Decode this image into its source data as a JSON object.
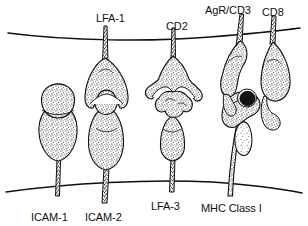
{
  "figure": {
    "background_color": "#ffffff",
    "ink_color": "#101010",
    "stipple_color": "#2a2a2a",
    "label_font_size_px": 11
  },
  "membranes": [
    {
      "name": "top-membrane",
      "semantic": "antigen-presenting-cell-membrane",
      "position": "top",
      "description": "gently sagging curved line across full width"
    },
    {
      "name": "bottom-membrane",
      "semantic": "t-cell-membrane",
      "position": "bottom",
      "description": "gently arched curved line across full width"
    }
  ],
  "labels": {
    "top": [
      {
        "id": "lfa1",
        "text": "LFA-1",
        "x": 96,
        "y": 12
      },
      {
        "id": "cd2",
        "text": "CD2",
        "x": 166,
        "y": 20
      },
      {
        "id": "agr_cd3",
        "text": "AgR/CD3",
        "x": 205,
        "y": 4
      },
      {
        "id": "cd8",
        "text": "CD8",
        "x": 262,
        "y": 6
      }
    ],
    "bottom": [
      {
        "id": "icam1",
        "text": "ICAM-1",
        "x": 31,
        "y": 211
      },
      {
        "id": "icam2",
        "text": "ICAM-2",
        "x": 85,
        "y": 211
      },
      {
        "id": "lfa3",
        "text": "LFA-3",
        "x": 151,
        "y": 200
      },
      {
        "id": "mhc1",
        "text": "MHC Class I",
        "x": 201,
        "y": 202
      }
    ]
  },
  "molecules": [
    {
      "id": "icam1",
      "name": "ICAM-1",
      "anchored_to": "bottom-membrane",
      "shape": "two-lobed stippled body on a narrow stalk",
      "partner": null
    },
    {
      "id": "icam2",
      "name": "ICAM-2",
      "anchored_to": "bottom-membrane",
      "shape": "tall tapering stippled body with small capped top lobe",
      "partner": "LFA-1"
    },
    {
      "id": "lfa1",
      "name": "LFA-1",
      "anchored_to": "top-membrane",
      "shape": "thin stalk widening into a cupped gripping head",
      "partner": "ICAM-2"
    },
    {
      "id": "cd2",
      "name": "CD2",
      "anchored_to": "top-membrane",
      "shape": "winged flared head cupping its ligand",
      "partner": "LFA-3"
    },
    {
      "id": "lfa3",
      "name": "LFA-3",
      "anchored_to": "bottom-membrane",
      "shape": "irregular lumpy star-like head on tapered stalk",
      "partner": "CD2"
    },
    {
      "id": "agr_cd3",
      "name": "AgR/CD3",
      "anchored_to": "top-membrane",
      "shape": "tall antigen receptor with broad lobed base",
      "partner": "MHC Class I"
    },
    {
      "id": "cd8",
      "name": "CD8",
      "anchored_to": "top-membrane",
      "shape": "teardrop lobe with hooked foot",
      "partner": "MHC Class I"
    },
    {
      "id": "mhc1",
      "name": "MHC Class I",
      "anchored_to": "bottom-membrane",
      "shape": "long stalk with peptide-binding groove and beta-2 microglobulin lobe",
      "partner": "AgR/CD3 and CD8"
    },
    {
      "id": "peptide",
      "name": "peptide",
      "shape": "small dark solid ellipse in the MHC groove",
      "fill": "#141414"
    },
    {
      "id": "b2m",
      "name": "beta-2-microglobulin",
      "shape": "small detached oval lobe beside the MHC stalk"
    }
  ]
}
